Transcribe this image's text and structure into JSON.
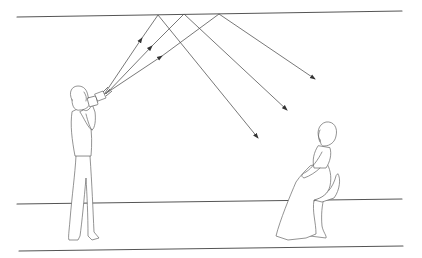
{
  "diagram": {
    "elements": {
      "ceiling_line": {
        "x1": 17,
        "y1": 17,
        "x2": 402,
        "y2": 11
      },
      "wall_floor_line": {
        "x1": 17,
        "y1": 204,
        "x2": 402,
        "y2": 199
      },
      "floor_front_line": {
        "x1": 19,
        "y1": 251,
        "x2": 403,
        "y2": 246
      },
      "rays": [
        {
          "from": [
            103,
            96
          ],
          "bounce": [
            158,
            15
          ],
          "to": [
            258,
            138
          ]
        },
        {
          "from": [
            106,
            94
          ],
          "bounce": [
            184,
            14
          ],
          "to": [
            287,
            110
          ]
        },
        {
          "from": [
            108,
            92
          ],
          "bounce": [
            219,
            14
          ],
          "to": [
            315,
            79
          ]
        }
      ],
      "photographer": {
        "label": "standing photographer with flash aimed at ceiling"
      },
      "subject": {
        "label": "seated woman on pedestal chair"
      }
    },
    "colors": {
      "stroke": "#555555",
      "background": "#ffffff"
    }
  }
}
